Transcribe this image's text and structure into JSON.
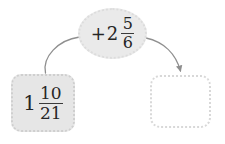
{
  "diagram": {
    "type": "function-machine",
    "background_color": "#ffffff",
    "input": {
      "label": "1 10/21",
      "whole": "1",
      "numerator": "10",
      "denominator": "21",
      "fill_color": "#e6e6e6",
      "border_color": "#cfcfcf"
    },
    "operator": {
      "label": "+2 5/6",
      "sign": "+",
      "whole": "2",
      "numerator": "5",
      "denominator": "6",
      "fill_color": "#eaeaea",
      "border_color": "#dcdcdc"
    },
    "output": {
      "label": "",
      "fill_color": "#ffffff",
      "border_color": "#d8d8d8"
    },
    "connectors": {
      "color": "#8f8f8f",
      "in_arrow_name": "input-to-operator-curve",
      "out_arrow_name": "operator-to-output-arrow"
    }
  }
}
